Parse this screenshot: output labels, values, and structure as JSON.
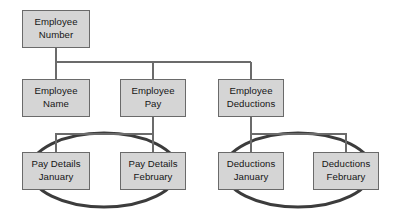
{
  "diagram": {
    "type": "hierarchy-tree",
    "colors": {
      "node_fill": "#d5d5d5",
      "node_border": "#6a6a6a",
      "node_text": "#151515",
      "connector": "#6b6b6b",
      "grouping_ellipse": "#3c3c3c",
      "canvas_background": "#ffffff"
    },
    "nodes": [
      {
        "id": "employee-number",
        "label_line1": "Employee",
        "label_line2": "Number",
        "level": 0,
        "x": 22,
        "y": 10,
        "w": 68,
        "h": 38
      },
      {
        "id": "employee-name",
        "label_line1": "Employee",
        "label_line2": "Name",
        "level": 1,
        "x": 22,
        "y": 79,
        "w": 68,
        "h": 38
      },
      {
        "id": "employee-pay",
        "label_line1": "Employee",
        "label_line2": "Pay",
        "level": 1,
        "x": 120,
        "y": 79,
        "w": 66,
        "h": 38
      },
      {
        "id": "employee-deductions",
        "label_line1": "Employee",
        "label_line2": "Deductions",
        "level": 1,
        "x": 218,
        "y": 79,
        "w": 66,
        "h": 38
      },
      {
        "id": "pay-details-january",
        "label_line1": "Pay Details",
        "label_line2": "January",
        "level": 2,
        "x": 22,
        "y": 152,
        "w": 68,
        "h": 38
      },
      {
        "id": "pay-details-february",
        "label_line1": "Pay Details",
        "label_line2": "February",
        "level": 2,
        "x": 120,
        "y": 152,
        "w": 66,
        "h": 38
      },
      {
        "id": "deductions-january",
        "label_line1": "Deductions",
        "label_line2": "January",
        "level": 2,
        "x": 218,
        "y": 152,
        "w": 66,
        "h": 38
      },
      {
        "id": "deductions-february",
        "label_line1": "Deductions",
        "label_line2": "February",
        "level": 2,
        "x": 313,
        "y": 152,
        "w": 66,
        "h": 38
      }
    ],
    "edges": [
      {
        "from": "employee-number",
        "to": "employee-name"
      },
      {
        "from": "employee-number",
        "to": "employee-pay"
      },
      {
        "from": "employee-number",
        "to": "employee-deductions"
      },
      {
        "from": "employee-pay",
        "to": "pay-details-january"
      },
      {
        "from": "employee-pay",
        "to": "pay-details-february"
      },
      {
        "from": "employee-deductions",
        "to": "deductions-january"
      },
      {
        "from": "employee-deductions",
        "to": "deductions-february"
      }
    ],
    "groups": [
      {
        "id": "pay-details-group",
        "members": [
          "pay-details-january",
          "pay-details-february"
        ],
        "shape": "ellipse",
        "cx": 104,
        "cy": 170,
        "rx": 74,
        "ry": 37
      },
      {
        "id": "deductions-group",
        "members": [
          "deductions-january",
          "deductions-february"
        ],
        "shape": "ellipse",
        "cx": 298,
        "cy": 170,
        "rx": 74,
        "ry": 37
      }
    ]
  }
}
